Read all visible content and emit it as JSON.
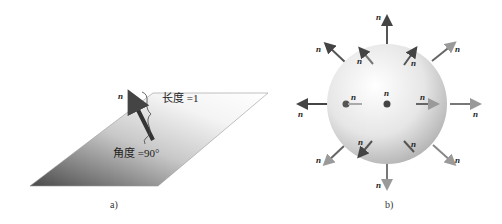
{
  "figure_a": {
    "caption": "a)",
    "normal_label": "n",
    "length_label": "长度 =1",
    "angle_label": "角度 =90°"
  },
  "figure_b": {
    "caption": "b)",
    "normal_label": "n",
    "normals": [
      {
        "pos": "top",
        "label": "n"
      },
      {
        "pos": "top-left",
        "label": "n"
      },
      {
        "pos": "top-right",
        "label": "n"
      },
      {
        "pos": "left",
        "label": "n"
      },
      {
        "pos": "right",
        "label": "n"
      },
      {
        "pos": "bottom-left",
        "label": "n"
      },
      {
        "pos": "bottom-right",
        "label": "n"
      },
      {
        "pos": "bottom",
        "label": "n"
      },
      {
        "pos": "inner-top-left",
        "label": "n"
      },
      {
        "pos": "inner-top-right",
        "label": "n"
      },
      {
        "pos": "inner-left",
        "label": "n"
      },
      {
        "pos": "inner-center",
        "label": "n"
      },
      {
        "pos": "inner-right",
        "label": "n"
      },
      {
        "pos": "inner-bottom-left",
        "label": "n"
      },
      {
        "pos": "inner-bottom-right",
        "label": "n"
      }
    ]
  }
}
